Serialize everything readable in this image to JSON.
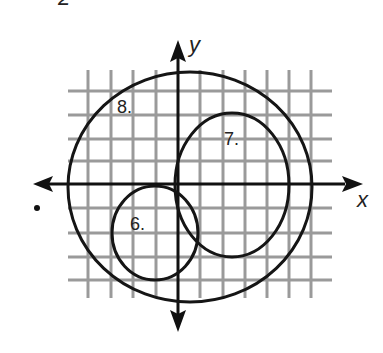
{
  "figure": {
    "top_fragment": "2",
    "axes": {
      "x_label": "x",
      "y_label": "y"
    },
    "circles": [
      {
        "label": "6.",
        "name": "circle-6"
      },
      {
        "label": "7.",
        "name": "circle-7"
      },
      {
        "label": "8.",
        "name": "circle-8"
      }
    ],
    "colors": {
      "grid": "#9a9a9a",
      "ink": "#151515",
      "background": "#ffffff"
    }
  }
}
